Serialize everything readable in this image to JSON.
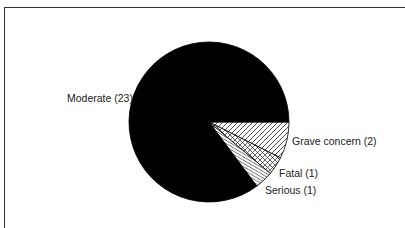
{
  "chart_data": {
    "type": "pie",
    "title": "",
    "total": 27,
    "start_angle_deg": 0,
    "direction": "clockwise",
    "slices": [
      {
        "label": "Grave concern",
        "value": 2,
        "display": "Grave concern (2)",
        "fill": "hatch-forward"
      },
      {
        "label": "Fatal",
        "value": 1,
        "display": "Fatal (1)",
        "fill": "crosshatch"
      },
      {
        "label": "Serious",
        "value": 1,
        "display": "Serious (1)",
        "fill": "hatch-back"
      },
      {
        "label": "Moderate",
        "value": 23,
        "display": "Moderate (23)",
        "fill": "solid-black"
      }
    ],
    "legend": "none (direct labels)"
  },
  "labels": {
    "moderate": "Moderate (23)",
    "grave": "Grave concern (2)",
    "fatal": "Fatal (1)",
    "serious": "Serious (1)"
  },
  "colors": {
    "solid": "#000000",
    "hatch_line": "#222222",
    "background": "#ffffff"
  }
}
